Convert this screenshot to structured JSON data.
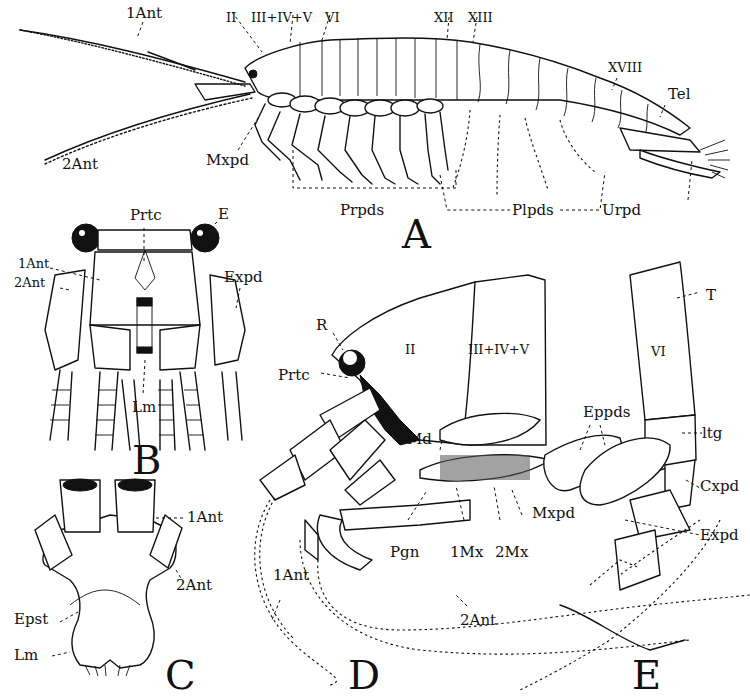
{
  "figure": {
    "panels": {
      "A": {
        "letter": "A",
        "labels": {
          "first_antenna": "1Ant",
          "second_antenna": "2Ant",
          "seg_II": "II",
          "seg_III_IV_V": "III+IV+V",
          "seg_VI": "VI",
          "seg_XII": "XII",
          "seg_XIII": "XIII",
          "seg_XVIII": "XVIII",
          "telson": "Tel",
          "maxilliped": "Mxpd",
          "pereiopods": "Prpds",
          "pleopods": "Plpds",
          "uropod": "Urpd"
        }
      },
      "B": {
        "letter": "B",
        "labels": {
          "protocephalon": "Prtc",
          "eye": "E",
          "first_antenna": "1Ant",
          "second_antenna": "2Ant",
          "exopodite": "Expd",
          "labrum": "Lm"
        }
      },
      "C": {
        "letter": "C",
        "labels": {
          "first_antenna": "1Ant",
          "second_antenna": "2Ant",
          "epistome": "Epst",
          "labrum": "Lm"
        }
      },
      "D": {
        "letter": "D",
        "labels": {
          "rostrum": "R",
          "protocephalon": "Prtc",
          "seg_II": "II",
          "seg_III_IV_V": "III+IV+V",
          "mandible": "Md",
          "paragnath": "Pgn",
          "first_maxilla": "1Mx",
          "second_maxilla": "2Mx",
          "maxilliped": "Mxpd",
          "first_antenna": "1Ant",
          "second_antenna": "2Ant"
        }
      },
      "E": {
        "letter": "E",
        "labels": {
          "tergum": "T",
          "seg_VI": "VI",
          "epipodites": "Eppds",
          "laterotergite": "ltg",
          "coxopodite": "Cxpd",
          "exopodite": "Expd"
        }
      }
    }
  }
}
